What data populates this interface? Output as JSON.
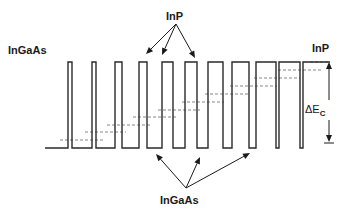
{
  "diagram": {
    "type": "conduction-band-profile",
    "labels": {
      "left_material": "InGaAs",
      "right_material": "InP",
      "top_barrier_label": "InP",
      "bottom_well_label": "InGaAs",
      "delta_ec_symbol": "ΔE",
      "delta_ec_subscript": "C"
    },
    "colors": {
      "line": "#2a2a2a",
      "dashed": "#555555",
      "text": "#1a1a1a",
      "background": "#ffffff"
    },
    "geometry": {
      "baseline_y": 148,
      "top_y": 62,
      "start_x": 45,
      "end_x": 330,
      "barriers": [
        {
          "x1": 68,
          "x2": 72
        },
        {
          "x1": 92,
          "x2": 96
        },
        {
          "x1": 115,
          "x2": 122
        },
        {
          "x1": 139,
          "x2": 147
        },
        {
          "x1": 162,
          "x2": 173
        },
        {
          "x1": 185,
          "x2": 197
        },
        {
          "x1": 208,
          "x2": 223
        },
        {
          "x1": 232,
          "x2": 249
        },
        {
          "x1": 256,
          "x2": 276
        },
        {
          "x1": 279,
          "x2": 300
        }
      ],
      "right_barrier_start_x": 303,
      "dashed_levels": [
        {
          "y": 140,
          "x1": 60,
          "x2": 103
        },
        {
          "y": 132,
          "x1": 85,
          "x2": 126
        },
        {
          "y": 125,
          "x1": 107,
          "x2": 150
        },
        {
          "y": 117,
          "x1": 133,
          "x2": 176
        },
        {
          "y": 110,
          "x1": 158,
          "x2": 200
        },
        {
          "y": 102,
          "x1": 182,
          "x2": 224
        },
        {
          "y": 94,
          "x1": 205,
          "x2": 250
        },
        {
          "y": 86,
          "x1": 230,
          "x2": 277
        },
        {
          "y": 78,
          "x1": 254,
          "x2": 300
        },
        {
          "y": 70,
          "x1": 278,
          "x2": 322
        },
        {
          "y": 62,
          "x1": 310,
          "x2": 330
        }
      ],
      "top_arrows": {
        "origin": [
          176,
          24
        ],
        "targets": [
          [
            146,
            54
          ],
          [
            162,
            55
          ],
          [
            195,
            58
          ]
        ]
      },
      "bottom_arrows": {
        "origin": [
          186,
          188
        ],
        "targets": [
          [
            156,
            154
          ],
          [
            200,
            157
          ],
          [
            250,
            153
          ]
        ]
      },
      "delta_ec_arrow": {
        "x": 329,
        "y_top": 62,
        "y_bottom": 150
      }
    }
  }
}
